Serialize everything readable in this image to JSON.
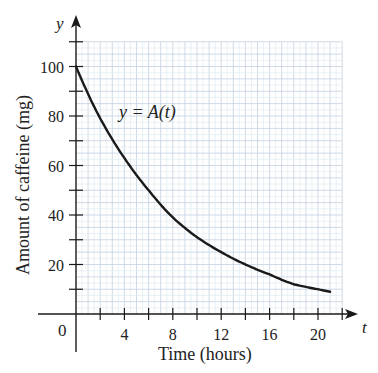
{
  "chart_data": {
    "type": "line",
    "title": "",
    "xlabel": "Time (hours)",
    "ylabel": "Amount of caffeine (mg)",
    "x_axis_symbol": "t",
    "y_axis_symbol": "y",
    "curve_label": "y = A(t)",
    "origin_label": "0",
    "xlim": [
      0,
      22
    ],
    "ylim": [
      0,
      110
    ],
    "x_ticks": [
      4,
      8,
      12,
      16,
      20
    ],
    "y_ticks": [
      20,
      40,
      60,
      80,
      100
    ],
    "grid": true,
    "grid_step": {
      "x": 1,
      "y": 5
    },
    "series": [
      {
        "name": "A(t)",
        "x": [
          0,
          2,
          4,
          6,
          8,
          10,
          12,
          14,
          16,
          18,
          20,
          21
        ],
        "values": [
          100,
          79,
          63,
          50,
          39,
          31,
          25,
          20,
          16,
          12,
          10,
          9
        ]
      }
    ]
  }
}
